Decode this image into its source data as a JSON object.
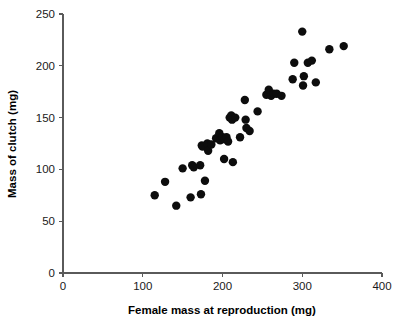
{
  "figure": {
    "width": 403,
    "height": 328,
    "background": "#ffffff",
    "marker_color": "#0d0d0d",
    "axis_color": "#5a5a5a",
    "text_color": "#1a1a1a"
  },
  "chart_data": {
    "type": "scatter",
    "title": "",
    "xlabel": "Female mass at reproduction (mg)",
    "ylabel": "Mass of clutch (mg)",
    "xlim": [
      0,
      400
    ],
    "ylim": [
      0,
      250
    ],
    "xticks": [
      0,
      100,
      200,
      300,
      400
    ],
    "yticks": [
      0,
      50,
      100,
      150,
      200,
      250
    ],
    "xtick_labels": [
      "0",
      "100",
      "200",
      "300",
      "400"
    ],
    "ytick_labels": [
      "0",
      "50",
      "100",
      "150",
      "200",
      "250"
    ],
    "grid": false,
    "legend": null,
    "marker": "filled-circle",
    "marker_size": 4.2,
    "n_points": 52,
    "points": [
      {
        "x": 115,
        "y": 75
      },
      {
        "x": 128,
        "y": 88
      },
      {
        "x": 142,
        "y": 65
      },
      {
        "x": 150,
        "y": 101
      },
      {
        "x": 160,
        "y": 73
      },
      {
        "x": 162,
        "y": 104
      },
      {
        "x": 164,
        "y": 102
      },
      {
        "x": 172,
        "y": 104
      },
      {
        "x": 173,
        "y": 76
      },
      {
        "x": 174,
        "y": 123
      },
      {
        "x": 175,
        "y": 122
      },
      {
        "x": 178,
        "y": 89
      },
      {
        "x": 181,
        "y": 125
      },
      {
        "x": 182,
        "y": 118
      },
      {
        "x": 186,
        "y": 124
      },
      {
        "x": 192,
        "y": 130
      },
      {
        "x": 196,
        "y": 135
      },
      {
        "x": 197,
        "y": 128
      },
      {
        "x": 200,
        "y": 131
      },
      {
        "x": 202,
        "y": 110
      },
      {
        "x": 203,
        "y": 129
      },
      {
        "x": 205,
        "y": 131
      },
      {
        "x": 207,
        "y": 127
      },
      {
        "x": 209,
        "y": 150
      },
      {
        "x": 211,
        "y": 152
      },
      {
        "x": 212,
        "y": 148
      },
      {
        "x": 213,
        "y": 107
      },
      {
        "x": 216,
        "y": 150
      },
      {
        "x": 222,
        "y": 131
      },
      {
        "x": 228,
        "y": 167
      },
      {
        "x": 229,
        "y": 148
      },
      {
        "x": 230,
        "y": 140
      },
      {
        "x": 234,
        "y": 137
      },
      {
        "x": 244,
        "y": 156
      },
      {
        "x": 255,
        "y": 172
      },
      {
        "x": 258,
        "y": 177
      },
      {
        "x": 261,
        "y": 171
      },
      {
        "x": 264,
        "y": 173
      },
      {
        "x": 268,
        "y": 173
      },
      {
        "x": 274,
        "y": 171
      },
      {
        "x": 288,
        "y": 187
      },
      {
        "x": 290,
        "y": 203
      },
      {
        "x": 300,
        "y": 233
      },
      {
        "x": 301,
        "y": 181
      },
      {
        "x": 302,
        "y": 190
      },
      {
        "x": 307,
        "y": 203
      },
      {
        "x": 312,
        "y": 205
      },
      {
        "x": 317,
        "y": 184
      },
      {
        "x": 334,
        "y": 216
      },
      {
        "x": 352,
        "y": 219
      }
    ]
  }
}
